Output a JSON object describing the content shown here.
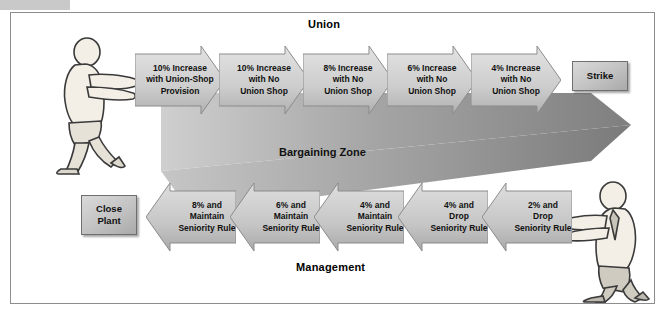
{
  "figure": {
    "top_label": "Union",
    "bottom_label": "Management",
    "zone_label": "Bargaining Zone"
  },
  "union_offers": [
    {
      "id": "union-offer-1",
      "lines": [
        "10% Increase",
        "with Union-Shop",
        "Provision"
      ]
    },
    {
      "id": "union-offer-2",
      "lines": [
        "10% Increase",
        "with No",
        "Union Shop"
      ]
    },
    {
      "id": "union-offer-3",
      "lines": [
        "8% Increase",
        "with No",
        "Union Shop"
      ]
    },
    {
      "id": "union-offer-4",
      "lines": [
        "6% Increase",
        "with No",
        "Union Shop"
      ]
    },
    {
      "id": "union-offer-5",
      "lines": [
        "4% Increase",
        "with No",
        "Union Shop"
      ]
    }
  ],
  "management_offers": [
    {
      "id": "mgmt-offer-1",
      "lines": [
        "8% and",
        "Maintain",
        "Seniority Rule"
      ]
    },
    {
      "id": "mgmt-offer-2",
      "lines": [
        "6% and",
        "Maintain",
        "Seniority Rule"
      ]
    },
    {
      "id": "mgmt-offer-3",
      "lines": [
        "4% and",
        "Maintain",
        "Seniority Rule"
      ]
    },
    {
      "id": "mgmt-offer-4",
      "lines": [
        "4% and",
        "Drop",
        "Seniority Rule"
      ]
    },
    {
      "id": "mgmt-offer-5",
      "lines": [
        "2% and",
        "Drop",
        "Seniority Rule"
      ]
    }
  ],
  "outcomes": {
    "strike": {
      "lines": [
        "Strike"
      ]
    },
    "close_plant": {
      "lines": [
        "Close",
        "Plant"
      ]
    }
  },
  "icons": {
    "union_person": "person-pushing-icon",
    "management_person": "person-pushing-icon"
  },
  "colors": {
    "arrow_light": "#d6d6d6",
    "arrow_dark": "#a8a8a8",
    "zone_dark": "#8f8f8f",
    "frame": "#8d8d8d",
    "text": "#111111"
  }
}
